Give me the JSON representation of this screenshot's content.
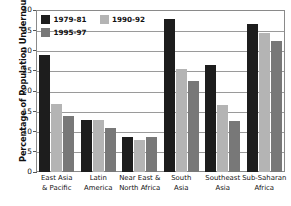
{
  "chart_data": {
    "type": "bar",
    "title": "",
    "subtitle": "",
    "xlabel": "",
    "ylabel": "Percentage of Population Undernourished",
    "ylim": [
      0,
      40
    ],
    "ytick_values": [
      0,
      5,
      10,
      15,
      20,
      25,
      30,
      35,
      40
    ],
    "ytick_labels": [
      "0",
      "5",
      "10",
      "15",
      "20",
      "25",
      "30",
      "35",
      "40"
    ],
    "grid": true,
    "legend_position": "top-left",
    "categories": [
      "East Asia\n& Pacific",
      "Latin\nAmerica",
      "Near East &\nNorth Africa",
      "South\nAsia",
      "Southeast\nAsia",
      "Sub-Saharan\nAfrica"
    ],
    "category_lines": [
      [
        "East Asia",
        "& Pacific"
      ],
      [
        "Latin",
        "America"
      ],
      [
        "Near East &",
        "North Africa"
      ],
      [
        "South",
        "Asia"
      ],
      [
        "Southeast",
        "Asia"
      ],
      [
        "Sub-Saharan",
        "Africa"
      ]
    ],
    "series": [
      {
        "name": "1979-81",
        "color": "#1d1d1d",
        "values": [
          28.9,
          12.9,
          8.7,
          37.8,
          26.5,
          36.6
        ]
      },
      {
        "name": "1990-92",
        "color": "#b4b4b4",
        "values": [
          16.9,
          12.8,
          7.8,
          25.5,
          16.5,
          34.3
        ]
      },
      {
        "name": "1995-97",
        "color": "#787878",
        "values": [
          13.9,
          10.8,
          8.7,
          22.5,
          12.5,
          32.4
        ]
      }
    ]
  },
  "legend": {
    "items": [
      {
        "label": "1979-81",
        "color": "#1d1d1d"
      },
      {
        "label": "1990-92",
        "color": "#b4b4b4"
      },
      {
        "label": "1995-97",
        "color": "#787878"
      }
    ]
  },
  "axis": {
    "y_title": "Percentage of Population Undernourished"
  }
}
